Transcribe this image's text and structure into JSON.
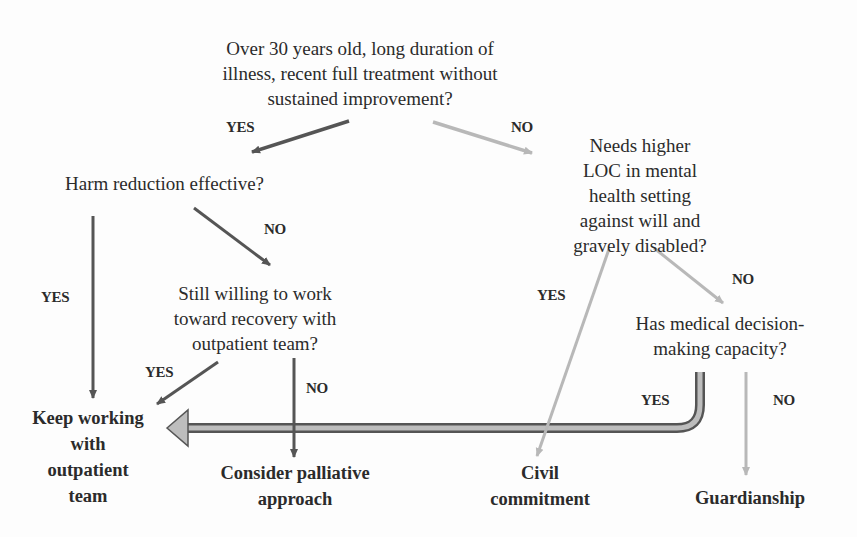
{
  "diagram": {
    "type": "decision-flowchart",
    "colors": {
      "dark_arrow": "#555555",
      "light_arrow": "#b8b8b8",
      "wide_arrow_fill": "#bdbdbd",
      "wide_arrow_border": "#555555",
      "text": "#2b2b2b"
    },
    "nodes": {
      "root": "Over 30 years old, long duration of\nillness, recent full treatment without\nsustained improvement?",
      "harm_reduction": "Harm reduction effective?",
      "still_willing": "Still willing to work\ntoward recovery with\noutpatient team?",
      "needs_higher_loc": "Needs higher\nLOC in mental\nhealth setting\nagainst will and\ngravely disabled?",
      "has_capacity": "Has medical decision-\nmaking capacity?",
      "keep_working": "Keep working\nwith\noutpatient\nteam",
      "palliative": "Consider palliative\napproach",
      "civil_commitment": "Civil\ncommitment",
      "guardianship": "Guardianship"
    },
    "edge_labels": {
      "root_yes": "YES",
      "root_no": "NO",
      "harm_yes": "YES",
      "harm_no": "NO",
      "willing_yes": "YES",
      "willing_no": "NO",
      "loc_yes": "YES",
      "loc_no": "NO",
      "capacity_yes": "YES",
      "capacity_no": "NO"
    },
    "edges": [
      {
        "from": "root",
        "to": "harm_reduction",
        "label": "YES"
      },
      {
        "from": "root",
        "to": "needs_higher_loc",
        "label": "NO"
      },
      {
        "from": "harm_reduction",
        "to": "keep_working",
        "label": "YES"
      },
      {
        "from": "harm_reduction",
        "to": "still_willing",
        "label": "NO"
      },
      {
        "from": "still_willing",
        "to": "keep_working",
        "label": "YES"
      },
      {
        "from": "still_willing",
        "to": "palliative",
        "label": "NO"
      },
      {
        "from": "needs_higher_loc",
        "to": "civil_commitment",
        "label": "YES"
      },
      {
        "from": "needs_higher_loc",
        "to": "has_capacity",
        "label": "NO"
      },
      {
        "from": "has_capacity",
        "to": "keep_working",
        "label": "YES"
      },
      {
        "from": "has_capacity",
        "to": "guardianship",
        "label": "NO"
      }
    ]
  }
}
